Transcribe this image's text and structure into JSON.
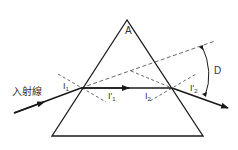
{
  "diagram": {
    "labels": {
      "apex_angle": "A",
      "incident_ray": "入射線",
      "incidence_angle_1": "I",
      "incidence_angle_1_sub": "1",
      "refraction_angle_1": "I'",
      "refraction_angle_1_sub": "1",
      "incidence_angle_2": "I",
      "incidence_angle_2_sub": "2",
      "refraction_angle_2": "I'",
      "refraction_angle_2_sub": "2",
      "deviation_angle": "D"
    },
    "colors": {
      "line": "#1a1a1a",
      "dashed": "#555555",
      "background": "#ffffff"
    }
  }
}
